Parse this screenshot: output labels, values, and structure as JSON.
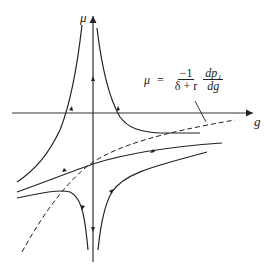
{
  "diagram": {
    "type": "phase-diagram",
    "axes": {
      "vertical": {
        "label": "μ"
      },
      "horizontal": {
        "label": "g"
      }
    },
    "formula": {
      "lhs": "μ",
      "equals": "=",
      "fraction1": {
        "numerator": "−1",
        "denominator": "δ + r"
      },
      "fraction2": {
        "numerator": "dp₁",
        "denominator": "dg"
      }
    },
    "curves": [
      {
        "name": "upper-left-trajectory",
        "style": "solid"
      },
      {
        "name": "upper-right-trajectory",
        "style": "solid"
      },
      {
        "name": "lower-left-trajectory",
        "style": "solid"
      },
      {
        "name": "lower-right-trajectory",
        "style": "solid"
      },
      {
        "name": "saddle-path",
        "style": "solid"
      },
      {
        "name": "mu-equals-curve",
        "style": "dashed"
      }
    ],
    "colors": {
      "line": "#222222",
      "background": "#ffffff"
    }
  }
}
